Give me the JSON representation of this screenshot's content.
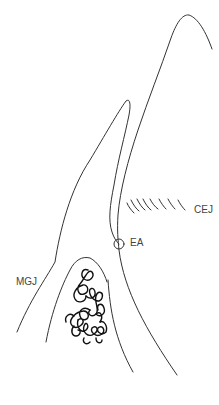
{
  "diagram": {
    "labels": {
      "cej": "CEJ",
      "ea": "EA",
      "mgj": "MGJ"
    },
    "colors": {
      "stroke": "#333333",
      "bone": "#111111",
      "background": "#ffffff"
    }
  }
}
